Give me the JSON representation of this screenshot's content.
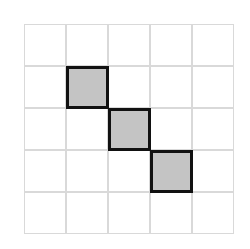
{
  "grid": {
    "rows": 5,
    "cols": 5,
    "cell_size": 42,
    "line_color": "#d9d9d9",
    "fill_color": "#c4c4c4",
    "border_color": "#111111",
    "filled_cells": [
      {
        "row": 1,
        "col": 1
      },
      {
        "row": 2,
        "col": 2
      },
      {
        "row": 3,
        "col": 3
      }
    ]
  }
}
